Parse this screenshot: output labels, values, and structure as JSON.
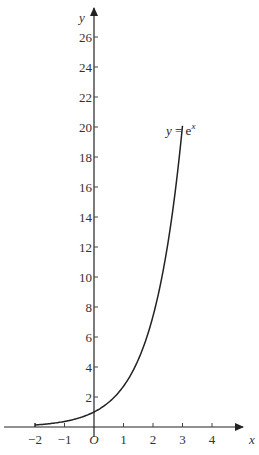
{
  "chart_data": {
    "type": "line",
    "title": "",
    "xlabel": "x",
    "ylabel": "y",
    "origin_label": "O",
    "xlim": [
      -2.7,
      4.9
    ],
    "ylim": [
      0,
      28
    ],
    "grid": false,
    "x_ticks": [
      -2,
      -1,
      1,
      2,
      3,
      4
    ],
    "x_tick_labels": [
      "−2",
      "−1",
      "1",
      "2",
      "3",
      "4"
    ],
    "y_ticks": [
      2,
      4,
      6,
      8,
      10,
      12,
      14,
      16,
      18,
      20,
      22,
      24,
      26
    ],
    "y_tick_labels": [
      "2",
      "4",
      "6",
      "8",
      "10",
      "12",
      "14",
      "16",
      "18",
      "20",
      "22",
      "24",
      "26"
    ],
    "series": [
      {
        "name": "y = e^x",
        "label_text": "y = e",
        "label_exp": "x",
        "function": "exp",
        "x_range": [
          -2,
          3
        ],
        "x": [
          -2,
          -1.5,
          -1,
          -0.5,
          0,
          0.5,
          1,
          1.5,
          2,
          2.5,
          3
        ],
        "values": [
          0.14,
          0.22,
          0.37,
          0.61,
          1,
          1.65,
          2.72,
          4.48,
          7.39,
          12.18,
          20.09
        ]
      }
    ],
    "layout": {
      "origin_px": [
        94,
        427
      ],
      "px_per_x_unit": 29.5,
      "px_per_y_unit": 15
    }
  }
}
